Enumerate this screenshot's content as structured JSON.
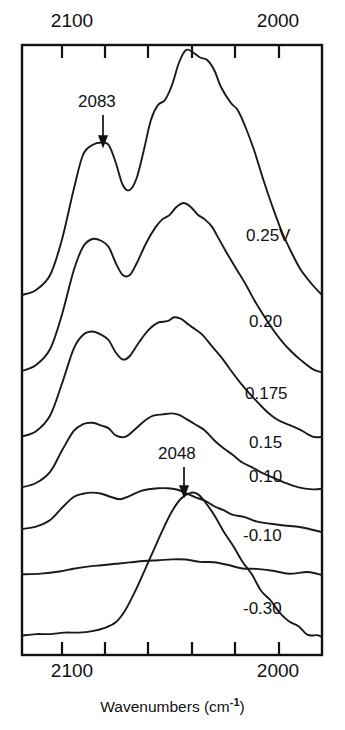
{
  "figure": {
    "kind": "infrared-spectra-stack",
    "xtitle_main": "Wavenumbers (cm",
    "xtitle_sup": "-1",
    "xtitle_close": ")"
  },
  "axes": {
    "top_left_label": "2100",
    "top_right_label": "2000",
    "bottom_left_label": "2100",
    "bottom_right_label": "2000"
  },
  "annotations": {
    "peak_high": "2083",
    "peak_low": "2048"
  },
  "traces": {
    "t0": "0.25V",
    "t1": "0.20",
    "t2": "0.175",
    "t3": "0.15",
    "t4": "0.10",
    "t5": "-0.10",
    "t6": "-0.30"
  },
  "chart_data": {
    "type": "line",
    "title": "",
    "xlabel": "Wavenumbers (cm^-1)",
    "ylabel": "",
    "xlim": [
      2120,
      1992
    ],
    "x_tick_labels": [
      "2100",
      "",
      "",
      "",
      "",
      "2000"
    ],
    "x_ticks": [
      2100,
      2080,
      2060,
      2040,
      2020,
      2000
    ],
    "x_axis_direction": "decreasing",
    "grid": false,
    "legend": "right-inline-trace-labels",
    "stacked_offset": true,
    "annotations": [
      {
        "text": "2083",
        "x": 2083,
        "series": "0.25V",
        "marker": "down-arrow"
      },
      {
        "text": "2048",
        "x": 2048,
        "series": "-0.30",
        "marker": "down-arrow"
      }
    ],
    "series": [
      {
        "name": "0.25V",
        "label": "0.25V",
        "baseline_px": 300,
        "peaks": [
          {
            "x": 2083,
            "label": "2083",
            "relative_height": 0.62
          },
          {
            "x": 2050,
            "label": "main",
            "relative_height": 1.0
          }
        ],
        "points": [
          [
            2120,
            0.02
          ],
          [
            2114,
            0.04
          ],
          [
            2108,
            0.1
          ],
          [
            2103,
            0.24
          ],
          [
            2098,
            0.44
          ],
          [
            2094,
            0.58
          ],
          [
            2090,
            0.62
          ],
          [
            2086,
            0.63
          ],
          [
            2083,
            0.62
          ],
          [
            2080,
            0.55
          ],
          [
            2077,
            0.46
          ],
          [
            2074,
            0.44
          ],
          [
            2071,
            0.49
          ],
          [
            2068,
            0.6
          ],
          [
            2065,
            0.72
          ],
          [
            2062,
            0.78
          ],
          [
            2059,
            0.8
          ],
          [
            2056,
            0.86
          ],
          [
            2053,
            0.95
          ],
          [
            2050,
            1.0
          ],
          [
            2047,
            0.99
          ],
          [
            2044,
            0.97
          ],
          [
            2041,
            0.96
          ],
          [
            2038,
            0.92
          ],
          [
            2035,
            0.85
          ],
          [
            2031,
            0.79
          ],
          [
            2028,
            0.76
          ],
          [
            2025,
            0.7
          ],
          [
            2021,
            0.6
          ],
          [
            2017,
            0.48
          ],
          [
            2013,
            0.37
          ],
          [
            2009,
            0.27
          ],
          [
            2005,
            0.19
          ],
          [
            2001,
            0.12
          ],
          [
            1996,
            0.06
          ],
          [
            1992,
            0.02
          ]
        ]
      },
      {
        "name": "0.20",
        "label": "0.20",
        "baseline_px": 375,
        "peaks": [
          {
            "x": 2083,
            "relative_height": 0.68
          },
          {
            "x": 2052,
            "relative_height": 0.86
          }
        ],
        "points": [
          [
            2120,
            0.02
          ],
          [
            2114,
            0.05
          ],
          [
            2108,
            0.13
          ],
          [
            2103,
            0.3
          ],
          [
            2098,
            0.52
          ],
          [
            2094,
            0.64
          ],
          [
            2090,
            0.68
          ],
          [
            2086,
            0.67
          ],
          [
            2083,
            0.64
          ],
          [
            2080,
            0.56
          ],
          [
            2077,
            0.5
          ],
          [
            2074,
            0.5
          ],
          [
            2071,
            0.56
          ],
          [
            2067,
            0.66
          ],
          [
            2063,
            0.74
          ],
          [
            2060,
            0.78
          ],
          [
            2057,
            0.8
          ],
          [
            2054,
            0.84
          ],
          [
            2051,
            0.86
          ],
          [
            2048,
            0.84
          ],
          [
            2045,
            0.8
          ],
          [
            2042,
            0.78
          ],
          [
            2039,
            0.74
          ],
          [
            2036,
            0.68
          ],
          [
            2033,
            0.62
          ],
          [
            2029,
            0.54
          ],
          [
            2025,
            0.46
          ],
          [
            2021,
            0.38
          ],
          [
            2017,
            0.3
          ],
          [
            2013,
            0.23
          ],
          [
            2009,
            0.17
          ],
          [
            2005,
            0.12
          ],
          [
            2001,
            0.07
          ],
          [
            1996,
            0.03
          ],
          [
            1992,
            0.01
          ]
        ]
      },
      {
        "name": "0.175",
        "label": "0.175",
        "baseline_px": 440,
        "peaks": [
          {
            "x": 2083,
            "relative_height": 0.62
          },
          {
            "x": 2054,
            "relative_height": 0.7
          }
        ],
        "points": [
          [
            2120,
            0.02
          ],
          [
            2114,
            0.05
          ],
          [
            2108,
            0.14
          ],
          [
            2103,
            0.32
          ],
          [
            2098,
            0.52
          ],
          [
            2094,
            0.6
          ],
          [
            2090,
            0.62
          ],
          [
            2086,
            0.6
          ],
          [
            2083,
            0.57
          ],
          [
            2080,
            0.5
          ],
          [
            2077,
            0.46
          ],
          [
            2074,
            0.48
          ],
          [
            2070,
            0.56
          ],
          [
            2066,
            0.63
          ],
          [
            2062,
            0.67
          ],
          [
            2058,
            0.68
          ],
          [
            2055,
            0.7
          ],
          [
            2052,
            0.69
          ],
          [
            2049,
            0.66
          ],
          [
            2046,
            0.63
          ],
          [
            2043,
            0.6
          ],
          [
            2039,
            0.54
          ],
          [
            2035,
            0.47
          ],
          [
            2031,
            0.4
          ],
          [
            2027,
            0.33
          ],
          [
            2023,
            0.27
          ],
          [
            2019,
            0.21
          ],
          [
            2015,
            0.16
          ],
          [
            2011,
            0.12
          ],
          [
            2006,
            0.08
          ],
          [
            2001,
            0.05
          ],
          [
            1996,
            0.02
          ],
          [
            1992,
            0.01
          ]
        ]
      },
      {
        "name": "0.15",
        "label": "0.15",
        "baseline_px": 490,
        "peaks": [
          {
            "x": 2083,
            "relative_height": 0.48
          },
          {
            "x": 2054,
            "relative_height": 0.55
          }
        ],
        "points": [
          [
            2120,
            0.02
          ],
          [
            2114,
            0.05
          ],
          [
            2108,
            0.13
          ],
          [
            2103,
            0.28
          ],
          [
            2098,
            0.42
          ],
          [
            2094,
            0.47
          ],
          [
            2090,
            0.48
          ],
          [
            2086,
            0.46
          ],
          [
            2083,
            0.44
          ],
          [
            2080,
            0.39
          ],
          [
            2076,
            0.38
          ],
          [
            2072,
            0.43
          ],
          [
            2068,
            0.49
          ],
          [
            2064,
            0.53
          ],
          [
            2060,
            0.54
          ],
          [
            2056,
            0.55
          ],
          [
            2053,
            0.54
          ],
          [
            2050,
            0.51
          ],
          [
            2046,
            0.47
          ],
          [
            2042,
            0.42
          ],
          [
            2038,
            0.36
          ],
          [
            2034,
            0.3
          ],
          [
            2030,
            0.25
          ],
          [
            2026,
            0.2
          ],
          [
            2022,
            0.16
          ],
          [
            2018,
            0.12
          ],
          [
            2013,
            0.09
          ],
          [
            2008,
            0.06
          ],
          [
            2002,
            0.03
          ],
          [
            1996,
            0.01
          ],
          [
            1992,
            0.0
          ]
        ]
      },
      {
        "name": "0.10",
        "label": "0.10",
        "baseline_px": 530,
        "peaks": [
          {
            "x": 2083,
            "relative_height": 0.34
          },
          {
            "x": 2054,
            "relative_height": 0.38
          }
        ],
        "points": [
          [
            2120,
            0.01
          ],
          [
            2114,
            0.03
          ],
          [
            2108,
            0.09
          ],
          [
            2103,
            0.2
          ],
          [
            2098,
            0.3
          ],
          [
            2094,
            0.33
          ],
          [
            2090,
            0.34
          ],
          [
            2086,
            0.33
          ],
          [
            2082,
            0.3
          ],
          [
            2078,
            0.28
          ],
          [
            2074,
            0.31
          ],
          [
            2070,
            0.35
          ],
          [
            2066,
            0.37
          ],
          [
            2062,
            0.38
          ],
          [
            2058,
            0.38
          ],
          [
            2054,
            0.37
          ],
          [
            2050,
            0.34
          ],
          [
            2046,
            0.3
          ],
          [
            2042,
            0.26
          ],
          [
            2038,
            0.22
          ],
          [
            2034,
            0.18
          ],
          [
            2030,
            0.14
          ],
          [
            2025,
            0.11
          ],
          [
            2020,
            0.08
          ],
          [
            2014,
            0.05
          ],
          [
            2008,
            0.03
          ],
          [
            2001,
            0.01
          ],
          [
            1992,
            0.0
          ]
        ]
      },
      {
        "name": "-0.10",
        "label": "-0.10",
        "baseline_px": 575,
        "peaks": [
          {
            "x": 2050,
            "relative_height": 0.22
          }
        ],
        "points": [
          [
            2120,
            0.01
          ],
          [
            2112,
            0.02
          ],
          [
            2104,
            0.05
          ],
          [
            2098,
            0.09
          ],
          [
            2092,
            0.12
          ],
          [
            2086,
            0.14
          ],
          [
            2080,
            0.16
          ],
          [
            2074,
            0.18
          ],
          [
            2068,
            0.2
          ],
          [
            2062,
            0.21
          ],
          [
            2056,
            0.22
          ],
          [
            2050,
            0.22
          ],
          [
            2044,
            0.2
          ],
          [
            2038,
            0.17
          ],
          [
            2032,
            0.13
          ],
          [
            2026,
            0.1
          ],
          [
            2020,
            0.07
          ],
          [
            2013,
            0.04
          ],
          [
            2006,
            0.02
          ],
          [
            1998,
            0.01
          ],
          [
            1992,
            0.0
          ]
        ]
      },
      {
        "name": "-0.30",
        "label": "-0.30",
        "baseline_px": 640,
        "peaks": [
          {
            "x": 2048,
            "label": "2048",
            "relative_height": 1.0
          }
        ],
        "points": [
          [
            2120,
            0.03
          ],
          [
            2114,
            0.04
          ],
          [
            2108,
            0.04
          ],
          [
            2102,
            0.05
          ],
          [
            2096,
            0.05
          ],
          [
            2090,
            0.06
          ],
          [
            2085,
            0.08
          ],
          [
            2080,
            0.12
          ],
          [
            2076,
            0.2
          ],
          [
            2072,
            0.32
          ],
          [
            2068,
            0.46
          ],
          [
            2064,
            0.6
          ],
          [
            2060,
            0.74
          ],
          [
            2056,
            0.87
          ],
          [
            2052,
            0.96
          ],
          [
            2048,
            1.0
          ],
          [
            2045,
            0.98
          ],
          [
            2042,
            0.93
          ],
          [
            2038,
            0.84
          ],
          [
            2034,
            0.74
          ],
          [
            2030,
            0.64
          ],
          [
            2026,
            0.54
          ],
          [
            2022,
            0.44
          ],
          [
            2018,
            0.34
          ],
          [
            2014,
            0.26
          ],
          [
            2010,
            0.19
          ],
          [
            2006,
            0.13
          ],
          [
            2002,
            0.09
          ],
          [
            1998,
            0.05
          ],
          [
            1994,
            0.03
          ],
          [
            1992,
            0.02
          ]
        ]
      }
    ]
  }
}
